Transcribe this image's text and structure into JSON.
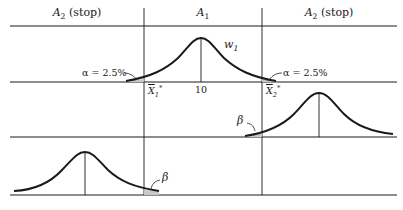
{
  "headers": {
    "left": {
      "main": "A",
      "sub": "2",
      "suffix": " (stop)"
    },
    "center": {
      "main": "A",
      "sub": "1"
    },
    "right": {
      "main": "A",
      "sub": "2",
      "suffix": " (stop)"
    }
  },
  "row1": {
    "curve_label": {
      "main": "w",
      "sub": "1"
    },
    "alpha_left": "α = 2.5%",
    "alpha_right": "α = 2.5%",
    "tick_center": "10",
    "x1": {
      "main": "X",
      "sub": "1",
      "sup": "*"
    },
    "x2": {
      "main": "X",
      "sub": "2",
      "sup": "*"
    }
  },
  "row2": {
    "beta_label": "β"
  },
  "row3": {
    "beta_label": "β"
  },
  "colors": {
    "line": "#1a1a1a",
    "shade": "#c8c8c8"
  }
}
